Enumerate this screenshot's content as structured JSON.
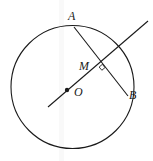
{
  "figure": {
    "kind": "geometry-diagram",
    "width": 153,
    "height": 161,
    "background_color": "#ffffff",
    "stroke_color": "#1a1a1a",
    "labels": {
      "center": "O",
      "chord_start": "A",
      "chord_end": "B",
      "intersection": "M"
    },
    "circle": {
      "cx": 72.5,
      "cy": 87,
      "r": 61.5
    },
    "points": {
      "A": {
        "x": 74,
        "y": 27
      },
      "B": {
        "x": 128,
        "y": 96
      },
      "M": {
        "x": 99,
        "y": 65
      },
      "O": {
        "x": 67,
        "y": 90
      }
    },
    "segments": [
      {
        "name": "chord-AB",
        "x1": 74,
        "y1": 27,
        "x2": 128,
        "y2": 96
      },
      {
        "name": "secant-line",
        "x1": 48,
        "y1": 107,
        "x2": 148,
        "y2": 21
      }
    ],
    "right_angle_marker": {
      "at": "M",
      "x": 101.5,
      "y": 68,
      "size": 3
    },
    "scan_band": {
      "left": 59,
      "width": 5
    }
  }
}
